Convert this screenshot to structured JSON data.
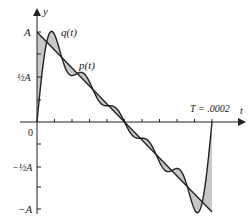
{
  "figure": {
    "axis_labels": {
      "y": "y",
      "x": "t"
    },
    "y_ticks": [
      {
        "label": "A",
        "value": 1
      },
      {
        "label": "½A",
        "value": 0.5
      },
      {
        "label": "0",
        "value": 0
      },
      {
        "label": "−½A",
        "value": -0.5
      },
      {
        "label": "−A",
        "value": -1
      }
    ],
    "curve_labels": {
      "q": "q(t)",
      "p": "p(t)"
    },
    "period_label": "T = .0002",
    "colors": {
      "line": "#222222",
      "shade": "#c8c8c8"
    }
  },
  "chart_data": {
    "type": "line",
    "title": "",
    "xlabel": "t",
    "ylabel": "y",
    "xlim": [
      0,
      0.0002
    ],
    "ylim": [
      -1,
      1
    ],
    "series": [
      {
        "name": "p(t)",
        "description": "sawtooth: straight line from A at t=0 to -A at t=T",
        "x": [
          0,
          0.0002
        ],
        "values": [
          1,
          -1
        ]
      },
      {
        "name": "q(t)",
        "description": "partial Fourier sum approximating p(t), oscillating about it; starts at 0, overshoots near A, ends at 0 at t=T"
      }
    ],
    "annotations": [
      "q(t)",
      "p(t)",
      "T = .0002"
    ],
    "y_tick_labels": [
      "A",
      "½A",
      "0",
      "−½A",
      "−A"
    ],
    "shaded_region": "area between p(t) and q(t)"
  }
}
